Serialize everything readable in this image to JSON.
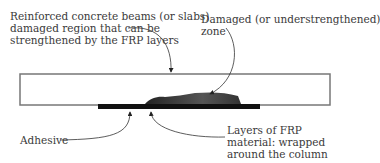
{
  "labels": {
    "beams": [
      "Reinforced concrete beams (or slabs)",
      "damaged region that can be",
      "strengthened by the FRP layers"
    ],
    "zone": [
      "Damaged (or understrengthened)",
      "zone"
    ],
    "adhesive": "Adhesive",
    "frp": [
      "Layers of FRP",
      "material: wrapped",
      "around the column"
    ]
  },
  "colors": {
    "outline": "#777777",
    "frp_bar": "#111111",
    "damage_fill": "#444444",
    "text": "#3a3a3a"
  }
}
